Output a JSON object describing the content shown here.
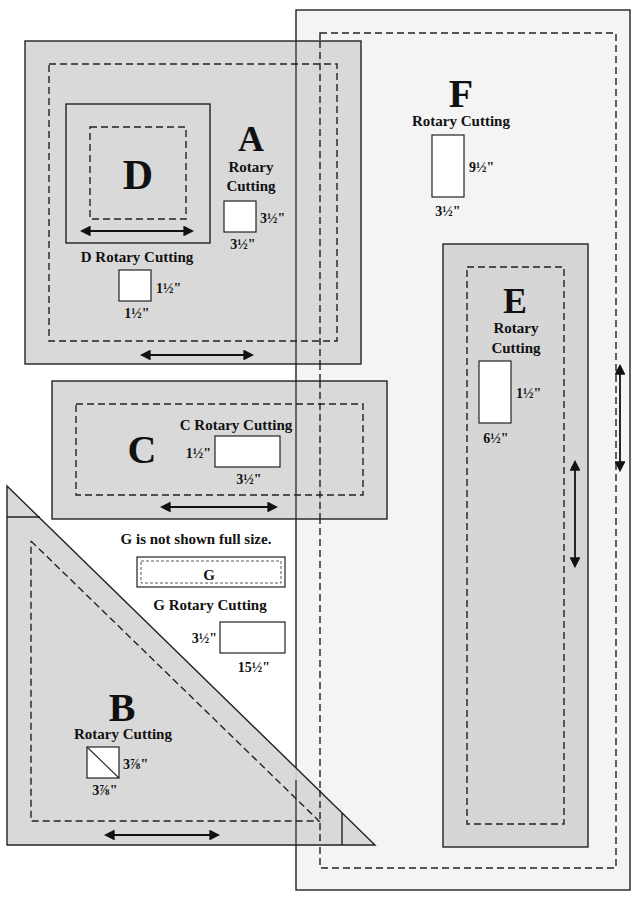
{
  "colors": {
    "piece_fill": "#d6d6d6",
    "piece_f_fill": "#f4f4f4",
    "line": "#222222",
    "text": "#111111"
  },
  "pieces": {
    "A": {
      "letter": "A",
      "label_line1": "Rotary",
      "label_line2": "Cutting",
      "height": "3½\"",
      "width": "3½\""
    },
    "B": {
      "letter": "B",
      "label": "Rotary Cutting",
      "height": "3⅞\"",
      "width": "3⅞\""
    },
    "C": {
      "letter": "C",
      "label": "C Rotary Cutting",
      "height": "1½\"",
      "width": "3½\""
    },
    "D": {
      "letter": "D",
      "label": "D Rotary Cutting",
      "height": "1½\"",
      "width": "1½\""
    },
    "E": {
      "letter": "E",
      "label_line1": "Rotary",
      "label_line2": "Cutting",
      "height": "1½\"",
      "width": "6½\""
    },
    "F": {
      "letter": "F",
      "label": "Rotary Cutting",
      "height": "9½\"",
      "width": "3½\""
    },
    "G": {
      "note": "G is not shown full size.",
      "letter": "G",
      "label": "G Rotary Cutting",
      "height": "3½\"",
      "width": "15½\""
    }
  }
}
